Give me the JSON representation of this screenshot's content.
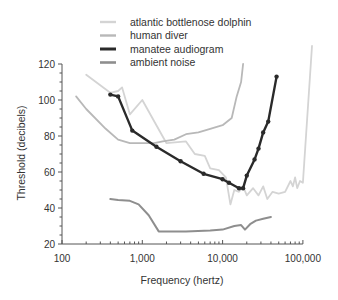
{
  "chart_data": {
    "type": "line",
    "title": "",
    "xlabel": "Frequency (hertz)",
    "ylabel": "Threshold (decibels)",
    "xscale": "log",
    "xlim": [
      100,
      150000
    ],
    "ylim": [
      20,
      120
    ],
    "x_ticks": [
      100,
      1000,
      10000,
      100000
    ],
    "x_tick_labels": [
      "100",
      "1,000",
      "10,000",
      "100,000"
    ],
    "y_ticks": [
      20,
      40,
      60,
      80,
      100,
      120
    ],
    "y_tick_labels": [
      "20",
      "40",
      "60",
      "80",
      "100",
      "120"
    ],
    "grid": false,
    "legend_position": "top",
    "series": [
      {
        "name": "atlantic bottlenose dolphin",
        "color": "#d4d4d4",
        "width": 1.8,
        "markers": false,
        "points": [
          [
            200,
            114
          ],
          [
            400,
            104
          ],
          [
            500,
            105
          ],
          [
            560,
            107
          ],
          [
            700,
            92
          ],
          [
            1000,
            100
          ],
          [
            1500,
            86
          ],
          [
            2000,
            76
          ],
          [
            3500,
            77
          ],
          [
            4500,
            70
          ],
          [
            6000,
            69
          ],
          [
            7000,
            62
          ],
          [
            9000,
            61
          ],
          [
            11000,
            57
          ],
          [
            12500,
            42
          ],
          [
            14000,
            50
          ],
          [
            16000,
            49
          ],
          [
            18000,
            52
          ],
          [
            20000,
            47
          ],
          [
            24000,
            51
          ],
          [
            28000,
            47
          ],
          [
            32000,
            52
          ],
          [
            36000,
            45
          ],
          [
            42000,
            49
          ],
          [
            50000,
            48
          ],
          [
            60000,
            49
          ],
          [
            70000,
            55
          ],
          [
            75000,
            52
          ],
          [
            80000,
            57
          ],
          [
            85000,
            51
          ],
          [
            92000,
            55
          ],
          [
            100000,
            54
          ],
          [
            130000,
            130
          ]
        ]
      },
      {
        "name": "human diver",
        "color": "#b8b8b8",
        "width": 1.8,
        "markers": false,
        "points": [
          [
            150,
            102
          ],
          [
            200,
            95
          ],
          [
            350,
            84
          ],
          [
            500,
            78
          ],
          [
            700,
            76
          ],
          [
            1000,
            76
          ],
          [
            1400,
            76
          ],
          [
            1800,
            77
          ],
          [
            2500,
            78
          ],
          [
            3500,
            81
          ],
          [
            5000,
            82
          ],
          [
            7000,
            84
          ],
          [
            10000,
            86
          ],
          [
            13000,
            90
          ],
          [
            15000,
            102
          ],
          [
            17000,
            110
          ],
          [
            18000,
            120
          ]
        ]
      },
      {
        "name": "manatee audiogram",
        "color": "#2a2a2a",
        "width": 2.4,
        "markers": true,
        "points": [
          [
            400,
            103
          ],
          [
            500,
            102
          ],
          [
            750,
            83
          ],
          [
            1500,
            74
          ],
          [
            3000,
            66
          ],
          [
            5800,
            59
          ],
          [
            10000,
            56
          ],
          [
            12000,
            54
          ],
          [
            16000,
            51
          ],
          [
            18000,
            51
          ],
          [
            20000,
            58
          ],
          [
            25000,
            67
          ],
          [
            28000,
            73
          ],
          [
            32000,
            82
          ],
          [
            37000,
            88
          ],
          [
            47000,
            113
          ]
        ]
      },
      {
        "name": "ambient noise",
        "color": "#8e8e8e",
        "width": 2.0,
        "markers": false,
        "points": [
          [
            400,
            45
          ],
          [
            500,
            44.5
          ],
          [
            700,
            44
          ],
          [
            900,
            42
          ],
          [
            1200,
            36
          ],
          [
            1600,
            27
          ],
          [
            2000,
            27
          ],
          [
            3500,
            27
          ],
          [
            7000,
            27.5
          ],
          [
            10000,
            28
          ],
          [
            14000,
            30
          ],
          [
            17000,
            30.5
          ],
          [
            19000,
            28
          ],
          [
            22000,
            31
          ],
          [
            26000,
            33
          ],
          [
            32000,
            34
          ],
          [
            40000,
            35
          ]
        ]
      }
    ]
  }
}
